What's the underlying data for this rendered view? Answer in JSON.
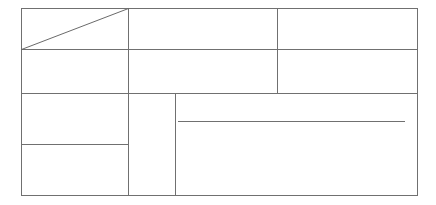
{
  "diagram": {
    "type": "empty-table-grid",
    "stroke_color": "#707070",
    "background": "#ffffff",
    "outer_frame": {
      "x1": 21,
      "y1": 8,
      "x2": 417,
      "y2": 195
    },
    "cells": [
      {
        "id": "r1c1",
        "label": "",
        "has_diagonal": true
      },
      {
        "id": "r1c2",
        "label": ""
      },
      {
        "id": "r1c3",
        "label": ""
      },
      {
        "id": "r2c1",
        "label": ""
      },
      {
        "id": "r2c2",
        "label": ""
      },
      {
        "id": "r2c3",
        "label": ""
      },
      {
        "id": "r3c1",
        "label": ""
      },
      {
        "id": "r4c1",
        "label": ""
      },
      {
        "id": "narrow-column",
        "label": ""
      },
      {
        "id": "large-panel",
        "label": ""
      }
    ]
  }
}
